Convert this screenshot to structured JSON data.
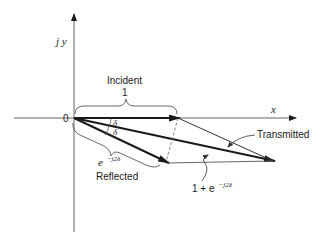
{
  "diagram": {
    "axes": {
      "x_label": "x",
      "y_label": "j y",
      "origin_label": "0"
    },
    "vectors": {
      "incident": {
        "label": "Incident",
        "magnitude_label": "1"
      },
      "reflected": {
        "label": "Reflected",
        "expr_base": "e",
        "expr_sup": "−j2δ"
      },
      "transmitted": {
        "label": "Transmitted"
      },
      "sum": {
        "expr_prefix": "1 + e",
        "expr_sup": "−j2δ"
      }
    },
    "angles": [
      "δ",
      "δ"
    ]
  }
}
